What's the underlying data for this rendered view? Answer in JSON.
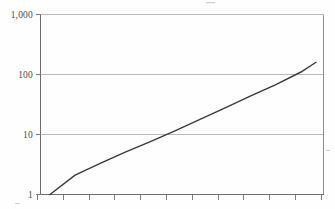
{
  "chart_data": {
    "type": "line",
    "title": "",
    "subtitle": "",
    "xlabel": "",
    "ylabel": "",
    "yscale": "log",
    "ylim": [
      1,
      1000
    ],
    "grid": true,
    "legend": false,
    "y_ticks": [
      {
        "value": 1000,
        "label": "1,000"
      },
      {
        "value": 100,
        "label": "100"
      },
      {
        "value": 10,
        "label": "10"
      },
      {
        "value": 1,
        "label": "1"
      }
    ],
    "x_ticks": [
      {
        "index": 0,
        "label": ""
      },
      {
        "index": 1,
        "label": ""
      },
      {
        "index": 2,
        "label": ""
      },
      {
        "index": 3,
        "label": ""
      },
      {
        "index": 4,
        "label": ""
      },
      {
        "index": 5,
        "label": ""
      },
      {
        "index": 6,
        "label": ""
      },
      {
        "index": 7,
        "label": ""
      },
      {
        "index": 8,
        "label": ""
      },
      {
        "index": 9,
        "label": ""
      },
      {
        "index": 10,
        "label": ""
      },
      {
        "index": 11,
        "label": ""
      }
    ],
    "x": [
      0,
      1,
      2,
      3,
      4,
      5,
      6,
      7,
      8,
      9,
      10,
      10.6
    ],
    "values": [
      1,
      2.1,
      3.3,
      5.1,
      7.6,
      11.6,
      18,
      28,
      44,
      68,
      110,
      160
    ],
    "series": [
      {
        "name": "series-1",
        "color": "#3b3b3b",
        "values": [
          1,
          2.1,
          3.3,
          5.1,
          7.6,
          11.6,
          18,
          28,
          44,
          68,
          110,
          160
        ]
      }
    ],
    "annotations": []
  },
  "colors": {
    "background": "#fefefe",
    "grid": "#b9b9b9",
    "frame": "#8e8e8e",
    "axis": "#6d6d6d",
    "tick": "#7c7c7c",
    "line": "#3b3b3b",
    "label_text": "#4a4a4a"
  }
}
